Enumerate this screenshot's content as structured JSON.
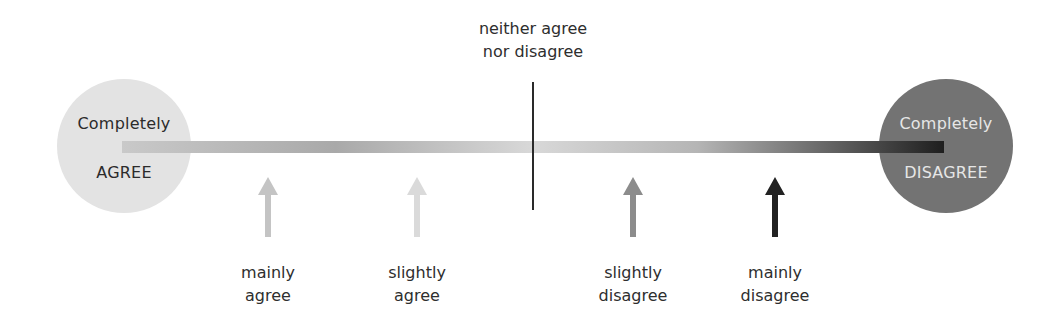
{
  "scale": {
    "left_end": {
      "line1": "Completely",
      "line2": "AGREE",
      "color": "#e3e3e3",
      "text_color": "#2b2b2b"
    },
    "right_end": {
      "line1": "Completely",
      "line2": "DISAGREE",
      "color": "#737373",
      "text_color": "#e6e6e6"
    },
    "midpoint": {
      "line1": "neither agree",
      "line2": "nor disagree"
    },
    "gradient_stops": [
      "#c9c9c9",
      "#a9a9a9",
      "#d8d8d8",
      "#b5b5b5",
      "#1e1e1e"
    ]
  },
  "points": [
    {
      "line1": "mainly",
      "line2": "agree",
      "color": "#c4c4c4"
    },
    {
      "line1": "slightly",
      "line2": "agree",
      "color": "#dadada"
    },
    {
      "line1": "slightly",
      "line2": "disagree",
      "color": "#8c8c8c"
    },
    {
      "line1": "mainly",
      "line2": "disagree",
      "color": "#222222"
    }
  ]
}
